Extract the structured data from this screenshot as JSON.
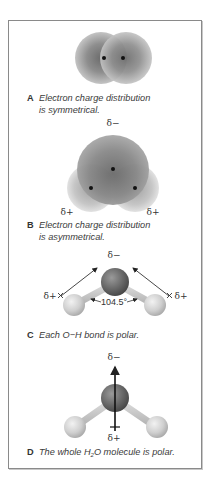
{
  "figure": {
    "panels": [
      {
        "letter": "A",
        "caption_line1": "Electron charge distribution",
        "caption_line2": "is symmetrical.",
        "model": "electron-cloud-h2"
      },
      {
        "letter": "B",
        "caption_line1": "Electron charge distribution",
        "caption_line2": "is asymmetrical.",
        "model": "electron-cloud-h2o",
        "labels": {
          "top": "δ−",
          "left": "δ+",
          "right": "δ+"
        }
      },
      {
        "letter": "C",
        "caption_line1": "Each O−H bond is polar.",
        "model": "ball-and-stick-h2o-bond-dipoles",
        "labels": {
          "top": "δ−",
          "left": "δ+",
          "right": "δ+",
          "angle": "104.5°"
        }
      },
      {
        "letter": "D",
        "caption_pre": "The whole H",
        "caption_sub": "2",
        "caption_post": "O molecule is polar.",
        "model": "ball-and-stick-h2o-net-dipole",
        "labels": {
          "top": "δ−",
          "bottom": "δ+"
        }
      }
    ],
    "colors": {
      "border": "#8a8a8a",
      "cloud_dark": "#6e6e6e",
      "cloud_light": "#d4d4d4",
      "oxygen": "#6a6a6a",
      "hydrogen": "#c8c8c8",
      "nucleus": "#111111",
      "text": "#333333"
    }
  }
}
